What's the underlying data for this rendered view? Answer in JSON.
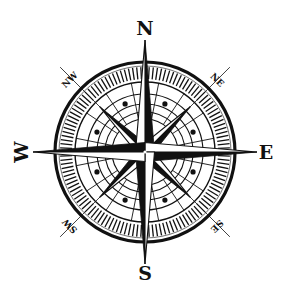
{
  "figure": {
    "type": "compass-rose",
    "width": 289,
    "height": 297,
    "center": [
      145,
      152
    ],
    "colors": {
      "ink": "#111111",
      "paper": "#ffffff"
    }
  },
  "cardinal_labels": {
    "north": "N",
    "south": "S",
    "east": "E",
    "west": "W"
  },
  "intercardinal_labels": {
    "northeast": "NE",
    "southeast": "SE",
    "southwest": "SW",
    "northwest": "NW"
  },
  "geometry": {
    "outer_ring_radius": 90,
    "tick_band_inner_radius": 73,
    "tick_band_outer_radius": 86,
    "tick_count": 128,
    "inner_ring_radii": [
      70,
      58,
      48,
      40,
      33
    ],
    "dot_ring_radius": 52,
    "dot_count": 8,
    "cardinal_point_length": 112,
    "intercardinal_point_length": 64,
    "intercardinal_guide_length": 112
  }
}
